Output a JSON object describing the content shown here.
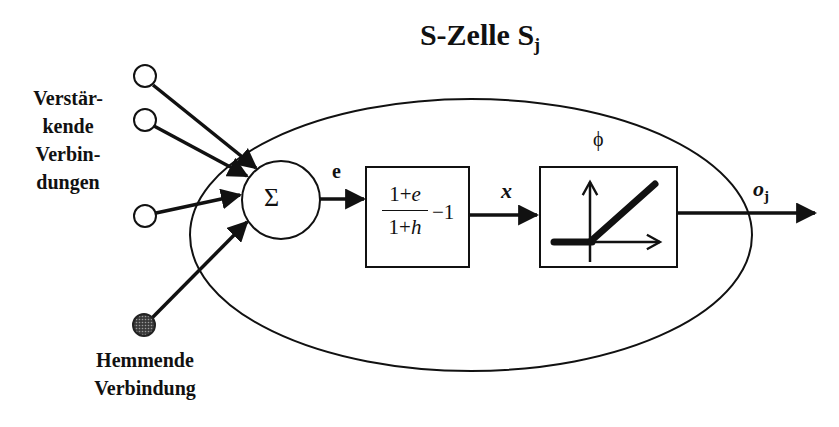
{
  "diagram": {
    "title": "S-Zelle S",
    "title_subscript": "j",
    "inputs": {
      "excitatory_label_lines": [
        "Verstär-",
        "kende",
        "Verbin-",
        "dungen"
      ],
      "excitatory_count": 3,
      "inhibitory_label_lines": [
        "Hemmende",
        "Verbindung"
      ],
      "inhibitory_count": 1
    },
    "summation": {
      "symbol": "Σ",
      "output_label": "e"
    },
    "transform_block": {
      "numerator": "1 + e",
      "numerator_parts": [
        "1+",
        "e"
      ],
      "denominator": "1 + h",
      "denominator_parts": [
        "1+",
        "h"
      ],
      "suffix": "−1",
      "output_label": "x"
    },
    "activation_block": {
      "label": "ϕ",
      "function": "ramp (linear threshold)"
    },
    "output": {
      "label": "o",
      "label_subscript": "j"
    },
    "colors": {
      "stroke": "#111111",
      "background": "#ffffff",
      "inhibitory_fill": "#555555"
    }
  }
}
